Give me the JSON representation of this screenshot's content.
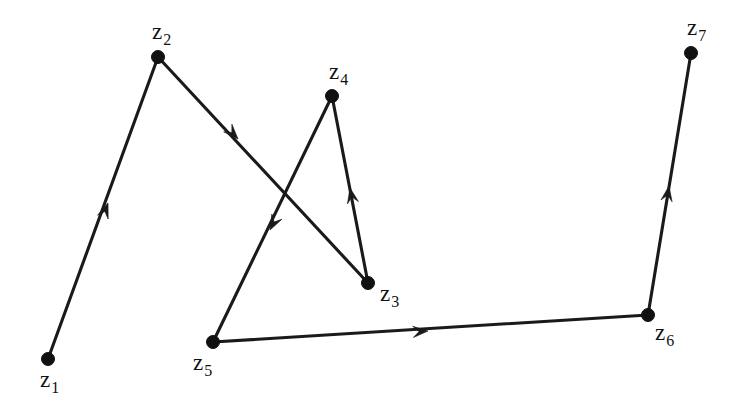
{
  "figure": {
    "background_color": "#ffffff",
    "ink_color": "#111111",
    "width": 751,
    "height": 414
  },
  "chart_data": {
    "type": "diagram",
    "subtype": "directed-graph-path",
    "title": "",
    "xlabel": "",
    "ylabel": "",
    "grid": false,
    "legend": "none",
    "xlim": [
      0,
      751
    ],
    "ylim": [
      0,
      414
    ],
    "nodes": [
      {
        "id": "z1",
        "base": "z",
        "sub": "1",
        "x": 48,
        "y": 359,
        "label_x": 40,
        "label_y": 368,
        "label_anchor": "below-left"
      },
      {
        "id": "z2",
        "base": "z",
        "sub": "2",
        "x": 158,
        "y": 57,
        "label_x": 152,
        "label_y": 20,
        "label_anchor": "above"
      },
      {
        "id": "z3",
        "base": "z",
        "sub": "3",
        "x": 368,
        "y": 283,
        "label_x": 380,
        "label_y": 282,
        "label_anchor": "right-below"
      },
      {
        "id": "z4",
        "base": "z",
        "sub": "4",
        "x": 332,
        "y": 96,
        "label_x": 329,
        "label_y": 60,
        "label_anchor": "above"
      },
      {
        "id": "z5",
        "base": "z",
        "sub": "5",
        "x": 213,
        "y": 342,
        "label_x": 193,
        "label_y": 351,
        "label_anchor": "below-left"
      },
      {
        "id": "z6",
        "base": "z",
        "sub": "6",
        "x": 648,
        "y": 315,
        "label_x": 655,
        "label_y": 321,
        "label_anchor": "right-below"
      },
      {
        "id": "z7",
        "base": "z",
        "sub": "7",
        "x": 691,
        "y": 53,
        "label_x": 687,
        "label_y": 16,
        "label_anchor": "above"
      }
    ],
    "node_radius": 6.5,
    "edges": [
      {
        "id": "e1",
        "from": "z1",
        "to": "z2",
        "directed": true,
        "arrow_x": 108,
        "arrow_y": 203,
        "arrow_angle_deg": -70.0
      },
      {
        "id": "e2",
        "from": "z2",
        "to": "z3",
        "directed": true,
        "arrow_x": 238,
        "arrow_y": 139,
        "arrow_angle_deg": 47.1
      },
      {
        "id": "e3",
        "from": "z3",
        "to": "z4",
        "directed": true,
        "arrow_x": 350,
        "arrow_y": 188,
        "arrow_angle_deg": -101.4
      },
      {
        "id": "e4",
        "from": "z4",
        "to": "z5",
        "directed": true,
        "arrow_x": 270,
        "arrow_y": 230,
        "arrow_angle_deg": 117.3
      },
      {
        "id": "e5",
        "from": "z5",
        "to": "z6",
        "directed": true,
        "arrow_x": 428,
        "arrow_y": 331,
        "arrow_angle_deg": -3.5
      },
      {
        "id": "e6",
        "from": "z6",
        "to": "z7",
        "directed": true,
        "arrow_x": 669,
        "arrow_y": 186,
        "arrow_angle_deg": -80.6
      }
    ],
    "path_sequence": [
      "z1",
      "z2",
      "z3",
      "z4",
      "z5",
      "z6",
      "z7"
    ],
    "annotations": []
  }
}
